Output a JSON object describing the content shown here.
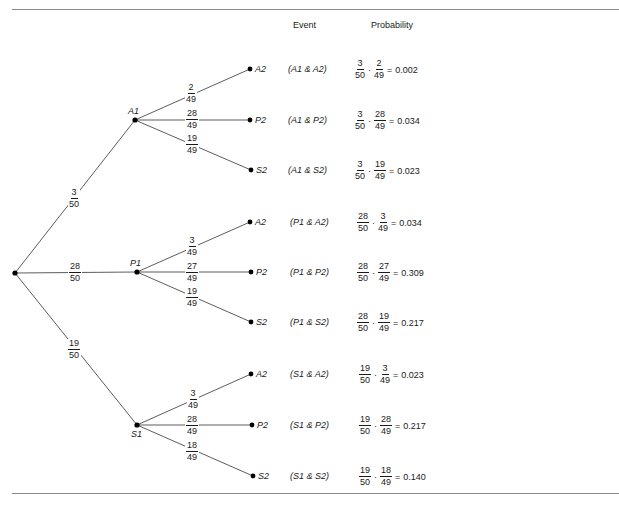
{
  "headers": {
    "event": "Event",
    "probability": "Probability"
  },
  "root": {
    "first_branches": [
      {
        "node": "A1",
        "prob": {
          "num": "3",
          "den": "50"
        }
      },
      {
        "node": "P1",
        "prob": {
          "num": "28",
          "den": "50"
        }
      },
      {
        "node": "S1",
        "prob": {
          "num": "19",
          "den": "50"
        }
      }
    ]
  },
  "subtrees": [
    {
      "node": "A1",
      "branches": [
        {
          "leaf": "A2",
          "prob": {
            "num": "2",
            "den": "49"
          },
          "event": "(A1 & A2)",
          "calc": {
            "f1": {
              "num": "3",
              "den": "50"
            },
            "f2": {
              "num": "2",
              "den": "49"
            },
            "result": "0.002"
          }
        },
        {
          "leaf": "P2",
          "prob": {
            "num": "28",
            "den": "49"
          },
          "event": "(A1 & P2)",
          "calc": {
            "f1": {
              "num": "3",
              "den": "50"
            },
            "f2": {
              "num": "28",
              "den": "49"
            },
            "result": "0.034"
          }
        },
        {
          "leaf": "S2",
          "prob": {
            "num": "19",
            "den": "49"
          },
          "event": "(A1 & S2)",
          "calc": {
            "f1": {
              "num": "3",
              "den": "50"
            },
            "f2": {
              "num": "19",
              "den": "49"
            },
            "result": "0.023"
          }
        }
      ]
    },
    {
      "node": "P1",
      "branches": [
        {
          "leaf": "A2",
          "prob": {
            "num": "3",
            "den": "49"
          },
          "event": "(P1 & A2)",
          "calc": {
            "f1": {
              "num": "28",
              "den": "50"
            },
            "f2": {
              "num": "3",
              "den": "49"
            },
            "result": "0.034"
          }
        },
        {
          "leaf": "P2",
          "prob": {
            "num": "27",
            "den": "49"
          },
          "event": "(P1 & P2)",
          "calc": {
            "f1": {
              "num": "28",
              "den": "50"
            },
            "f2": {
              "num": "27",
              "den": "49"
            },
            "result": "0.309"
          }
        },
        {
          "leaf": "S2",
          "prob": {
            "num": "19",
            "den": "49"
          },
          "event": "(P1 & S2)",
          "calc": {
            "f1": {
              "num": "28",
              "den": "50"
            },
            "f2": {
              "num": "19",
              "den": "49"
            },
            "result": "0.217"
          }
        }
      ]
    },
    {
      "node": "S1",
      "branches": [
        {
          "leaf": "A2",
          "prob": {
            "num": "3",
            "den": "49"
          },
          "event": "(S1 & A2)",
          "calc": {
            "f1": {
              "num": "19",
              "den": "50"
            },
            "f2": {
              "num": "3",
              "den": "49"
            },
            "result": "0.023"
          }
        },
        {
          "leaf": "P2",
          "prob": {
            "num": "28",
            "den": "49"
          },
          "event": "(S1 & P2)",
          "calc": {
            "f1": {
              "num": "19",
              "den": "50"
            },
            "f2": {
              "num": "28",
              "den": "49"
            },
            "result": "0.217"
          }
        },
        {
          "leaf": "S2",
          "prob": {
            "num": "18",
            "den": "49"
          },
          "event": "(S1 & S2)",
          "calc": {
            "f1": {
              "num": "19",
              "den": "50"
            },
            "f2": {
              "num": "18",
              "den": "49"
            },
            "result": "0.140"
          }
        }
      ]
    }
  ],
  "symbols": {
    "dot": "·",
    "equals": "="
  },
  "colors": {
    "line": "#4a4a4a",
    "node": "#000000",
    "rule": "#8a8a8a"
  }
}
